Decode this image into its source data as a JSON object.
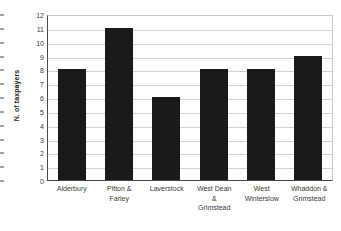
{
  "chart_data": {
    "type": "bar",
    "title": "",
    "subtitle": "",
    "xlabel": "",
    "ylabel": "N. of taxpayers",
    "categories": [
      "Alderbury",
      "Pitton & Farley",
      "Laverstock",
      "West Dean & Grimstead",
      "West Winterslow",
      "Whaddon & Grimstead"
    ],
    "category_lines": [
      [
        "Alderbury"
      ],
      [
        "Pitton &",
        "Farley"
      ],
      [
        "Laverstock"
      ],
      [
        "West Dean",
        "&",
        "Grimstead"
      ],
      [
        "West",
        "Winterslow"
      ],
      [
        "Whaddon &",
        "Grimstead"
      ]
    ],
    "values": [
      8,
      11,
      6,
      8,
      8,
      9
    ],
    "ylim": [
      0,
      12
    ],
    "ytick_step": 1,
    "yticks": [
      12,
      11,
      10,
      9,
      8,
      7,
      6,
      5,
      4,
      3,
      2,
      1,
      0
    ],
    "grid": true,
    "grid_axis": "y",
    "legend": false,
    "legend_position": "none",
    "bar_color": "#1a1a1a",
    "gridline_color": "#d2d2d2",
    "axis_color": "#4a4a4a",
    "plot_background": "#ffffff"
  }
}
